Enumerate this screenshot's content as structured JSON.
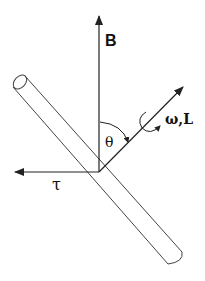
{
  "diagram": {
    "type": "vector diagram of a rotating rod in a magnetic field",
    "labels": {
      "field": "B",
      "angular": "ω,L",
      "angle": "θ",
      "torque": "τ"
    },
    "vectors": [
      {
        "name": "B",
        "description": "magnetic field, vertical up"
      },
      {
        "name": "ω,L",
        "description": "angular velocity / angular momentum, along rod axis up-right"
      },
      {
        "name": "τ",
        "description": "torque, horizontal left"
      }
    ],
    "colors": {
      "ink": "#222222",
      "background": "#ffffff"
    }
  }
}
